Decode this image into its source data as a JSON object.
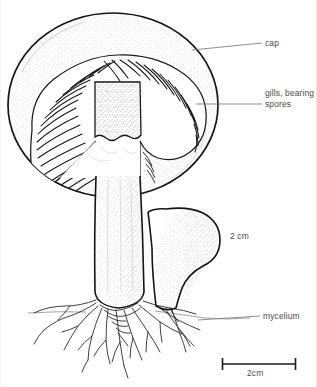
{
  "figure": {
    "style": "line-drawing-stippled",
    "ink_color": "#1a1a1a",
    "text_color": "#4a4a4a",
    "background_color": "#ffffff"
  },
  "labels": {
    "cap": "cap",
    "gills_line1": "gills, bearing",
    "gills_line2": "spores",
    "mycelium": "mycelium",
    "measure": "2 cm",
    "scale_bar": "2cm"
  },
  "parts": [
    {
      "id": "cap",
      "label": "cap",
      "leader_from": [
        192,
        50
      ],
      "leader_to": [
        262,
        43
      ]
    },
    {
      "id": "gills",
      "label": "gills, bearing spores",
      "leader_from": [
        196,
        104
      ],
      "leader_to": [
        262,
        104
      ]
    },
    {
      "id": "mycelium",
      "label": "mycelium",
      "leader_from": [
        198,
        320
      ],
      "leader_to": [
        260,
        316
      ]
    }
  ],
  "scale": {
    "bar_label": "2cm",
    "bar_x_start": 222,
    "bar_x_end": 296,
    "bar_y": 364,
    "annotation": "2 cm",
    "annotation_x": 230,
    "annotation_y": 231
  }
}
